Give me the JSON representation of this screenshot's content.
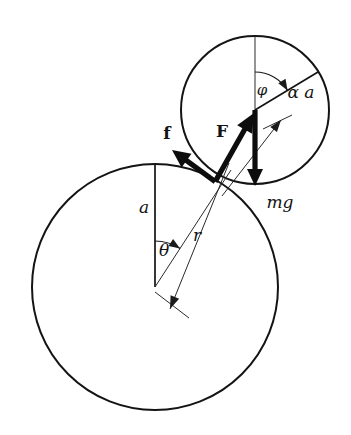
{
  "figure": {
    "background_color": "#ffffff",
    "ink_color": "#141414",
    "width": 351,
    "height": 435
  },
  "bodies": {
    "large_circle": {
      "name": "large-circle",
      "center_x": 155,
      "center_y": 287,
      "radius": 123,
      "stroke_width": 2.0
    },
    "small_circle": {
      "name": "small-circle",
      "center_x": 255,
      "center_y": 110,
      "radius": 74,
      "stroke_width": 2.0
    },
    "contact_point": {
      "name": "contact-point",
      "x": 215.2,
      "y": 181.6
    }
  },
  "labels": {
    "radius_a": "a",
    "angle_theta": "θ",
    "radius_r": "r",
    "angle_phi": "φ",
    "alpha_a": "α a",
    "friction_force": "f",
    "normal_force": "F",
    "weight": "mg"
  },
  "label_positions": {
    "radius_a": {
      "x": 144,
      "y": 208
    },
    "angle_theta": {
      "x": 164,
      "y": 251
    },
    "radius_r": {
      "x": 197,
      "y": 236
    },
    "angle_phi": {
      "x": 262,
      "y": 91
    },
    "alpha_a": {
      "x": 301,
      "y": 93
    },
    "friction_force": {
      "x": 167,
      "y": 134
    },
    "normal_force": {
      "x": 222,
      "y": 132
    },
    "weight": {
      "x": 280,
      "y": 203
    }
  },
  "vectors": {
    "friction_force": {
      "name": "friction-vector-f",
      "from_x": 215.2,
      "from_y": 181.6,
      "to_x": 172.0,
      "to_y": 150.0,
      "style": "bold-arrow",
      "direction": "up-left"
    },
    "normal_force": {
      "name": "normal-vector-F",
      "from_x": 215.2,
      "from_y": 181.6,
      "to_x": 254.0,
      "to_y": 113.0,
      "style": "bold-arrow",
      "direction": "up-right"
    },
    "weight": {
      "name": "weight-vector-mg",
      "from_x": 255.0,
      "from_y": 110.0,
      "to_x": 255.0,
      "to_y": 186.0,
      "style": "bold-arrow",
      "direction": "down"
    }
  },
  "construction_lines": {
    "vertical_a": {
      "name": "radius-line-a",
      "from_x": 155,
      "from_y": 287,
      "to_x": 155,
      "to_y": 164
    },
    "center_to_contact": {
      "name": "center-to-contact-ray",
      "from_x": 155,
      "from_y": 287,
      "to_x": 231,
      "to_y": 170
    },
    "dimension_r": {
      "name": "dimension-line-r",
      "from_x": 229,
      "from_y": 163,
      "to_x": 170,
      "to_y": 309
    },
    "small_vertical": {
      "name": "small-circle-vertical",
      "from_x": 255,
      "from_y": 110,
      "to_x": 255,
      "to_y": 36
    },
    "alpha_a_radius": {
      "name": "alpha-a-radius-line",
      "from_x": 255,
      "from_y": 110,
      "to_x": 318,
      "to_y": 72
    },
    "dimension_alpha_a": {
      "name": "dimension-line-alpha-a",
      "from_x": 222,
      "from_y": 196,
      "to_x": 281,
      "to_y": 120
    },
    "alpha_a_tick": {
      "name": "alpha-a-tick-mark",
      "from_x": 263,
      "from_y": 129,
      "to_x": 292,
      "to_y": 115
    },
    "r_tick": {
      "name": "r-tick-mark",
      "from_x": 155,
      "from_y": 292,
      "to_x": 189,
      "to_y": 318
    }
  },
  "angle_arcs": {
    "theta": {
      "name": "angle-arc-theta",
      "vertex_x": 155,
      "vertex_y": 287,
      "radius": 46,
      "start_deg": -90,
      "end_deg": -57,
      "label": "θ"
    },
    "phi": {
      "name": "angle-arc-phi",
      "vertex_x": 255,
      "vertex_y": 110,
      "radius": 38,
      "start_deg": -90,
      "end_deg": -31,
      "label": "φ"
    }
  }
}
